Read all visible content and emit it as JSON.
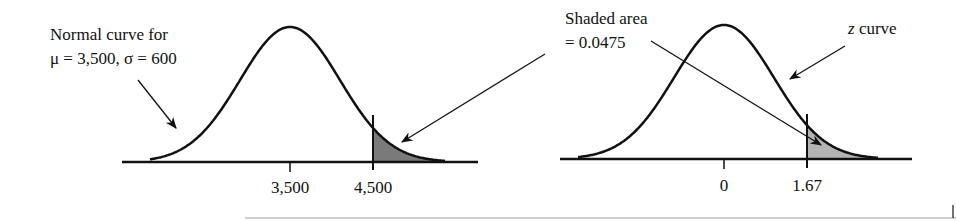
{
  "left_panel": {
    "label_line1": "Normal curve for",
    "label_line2": "μ = 3,500, σ = 600",
    "mean": 3500,
    "sd": 600,
    "ticks": [
      "3,500",
      "4,500"
    ],
    "shade_from": 4500
  },
  "center_annotation": {
    "line1": "Shaded area",
    "line2": "= 0.0475",
    "shaded_area": 0.0475
  },
  "right_panel": {
    "label_z": "z",
    "label_rest": " curve",
    "ticks": [
      "0",
      "1.67"
    ],
    "shade_from": 1.67
  },
  "colors": {
    "curve": "#111111",
    "shade_left": "#7a7a7a",
    "shade_right": "#b4b4b4"
  }
}
